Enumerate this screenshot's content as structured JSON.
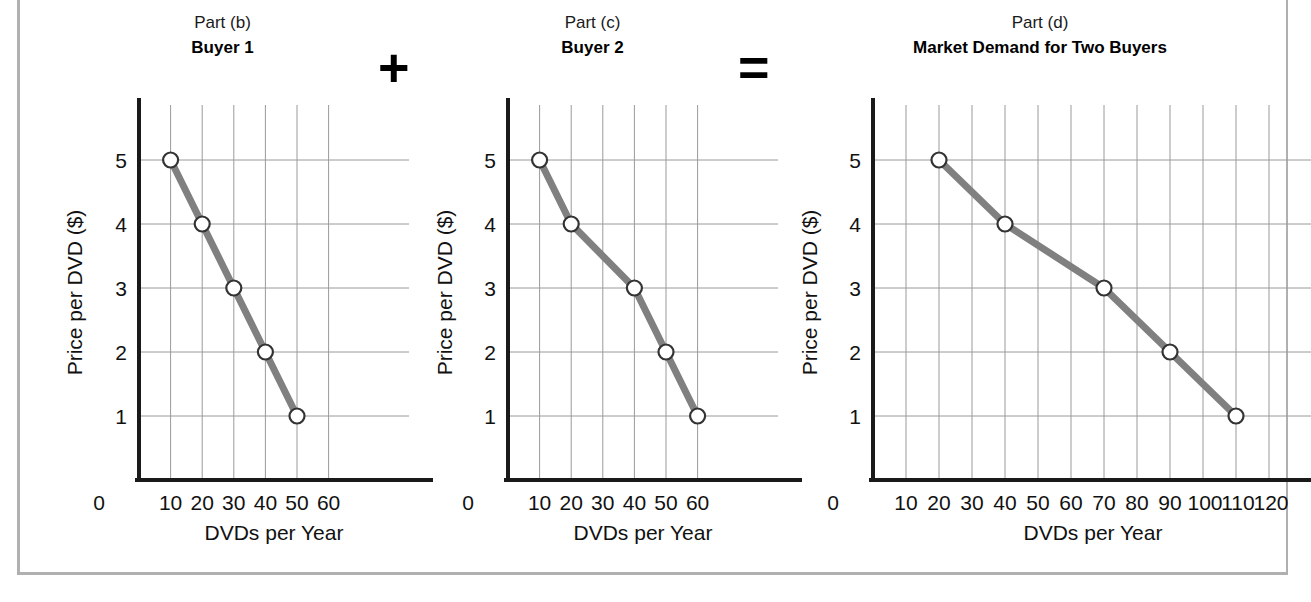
{
  "figure": {
    "operators": [
      {
        "name": "plus",
        "symbol": "+"
      },
      {
        "name": "equals",
        "symbol": "="
      }
    ]
  },
  "panels": [
    {
      "part_label": "Part (b)",
      "title": "Buyer 1",
      "xlabel": "DVDs per Year",
      "ylabel": "Price per DVD ($)",
      "xticks": [
        "0",
        "10",
        "20",
        "30",
        "40",
        "50",
        "60"
      ],
      "yticks": [
        "5",
        "4",
        "3",
        "2",
        "1"
      ]
    },
    {
      "part_label": "Part (c)",
      "title": "Buyer 2",
      "xlabel": "DVDs per Year",
      "ylabel": "Price per DVD ($)",
      "xticks": [
        "0",
        "10",
        "20",
        "30",
        "40",
        "50",
        "60"
      ],
      "yticks": [
        "5",
        "4",
        "3",
        "2",
        "1"
      ]
    },
    {
      "part_label": "Part (d)",
      "title": "Market Demand for Two Buyers",
      "xlabel": "DVDs per Year",
      "ylabel": "Price per DVD ($)",
      "xticks": [
        "0",
        "10",
        "20",
        "30",
        "40",
        "50",
        "60",
        "70",
        "80",
        "90",
        "100",
        "110",
        "120"
      ],
      "yticks": [
        "5",
        "4",
        "3",
        "2",
        "1"
      ]
    }
  ],
  "chart_data": [
    {
      "type": "line",
      "title": "Buyer 1",
      "subtitle": "Part (b)",
      "xlabel": "DVDs per Year",
      "ylabel": "Price per DVD ($)",
      "xlim": [
        0,
        60
      ],
      "ylim": [
        0,
        5.6
      ],
      "xticks": [
        0,
        10,
        20,
        30,
        40,
        50,
        60
      ],
      "yticks": [
        1,
        2,
        3,
        4,
        5
      ],
      "grid": true,
      "legend": "none",
      "x": [
        10,
        20,
        30,
        40,
        50
      ],
      "y": [
        5,
        4,
        3,
        2,
        1
      ],
      "series": [
        {
          "name": "Buyer 1 demand",
          "quantity": [
            10,
            20,
            30,
            40,
            50
          ],
          "price": [
            5,
            4,
            3,
            2,
            1
          ]
        }
      ]
    },
    {
      "type": "line",
      "title": "Buyer 2",
      "subtitle": "Part (c)",
      "xlabel": "DVDs per Year",
      "ylabel": "Price per DVD ($)",
      "xlim": [
        0,
        60
      ],
      "ylim": [
        0,
        5.6
      ],
      "xticks": [
        0,
        10,
        20,
        30,
        40,
        50,
        60
      ],
      "yticks": [
        1,
        2,
        3,
        4,
        5
      ],
      "grid": true,
      "legend": "none",
      "x": [
        10,
        20,
        40,
        50,
        60
      ],
      "y": [
        5,
        4,
        3,
        2,
        1
      ],
      "series": [
        {
          "name": "Buyer 2 demand",
          "quantity": [
            10,
            20,
            40,
            50,
            60
          ],
          "price": [
            5,
            4,
            3,
            2,
            1
          ]
        }
      ]
    },
    {
      "type": "line",
      "title": "Market Demand for Two Buyers",
      "subtitle": "Part (d)",
      "xlabel": "DVDs per Year",
      "ylabel": "Price per DVD ($)",
      "xlim": [
        0,
        120
      ],
      "ylim": [
        0,
        5.6
      ],
      "xticks": [
        0,
        10,
        20,
        30,
        40,
        50,
        60,
        70,
        80,
        90,
        100,
        110,
        120
      ],
      "yticks": [
        1,
        2,
        3,
        4,
        5
      ],
      "grid": true,
      "legend": "none",
      "x": [
        20,
        40,
        70,
        90,
        110
      ],
      "y": [
        5,
        4,
        3,
        2,
        1
      ],
      "series": [
        {
          "name": "Market demand",
          "quantity": [
            20,
            40,
            70,
            90,
            110
          ],
          "price": [
            5,
            4,
            3,
            2,
            1
          ]
        }
      ]
    }
  ],
  "colors": {
    "curve": "#808080",
    "marker_fill": "#ffffff",
    "marker_stroke": "#333333",
    "axis": "#1a1a1a",
    "grid": "#9a9a9a",
    "frame": "#b0b0b0"
  }
}
